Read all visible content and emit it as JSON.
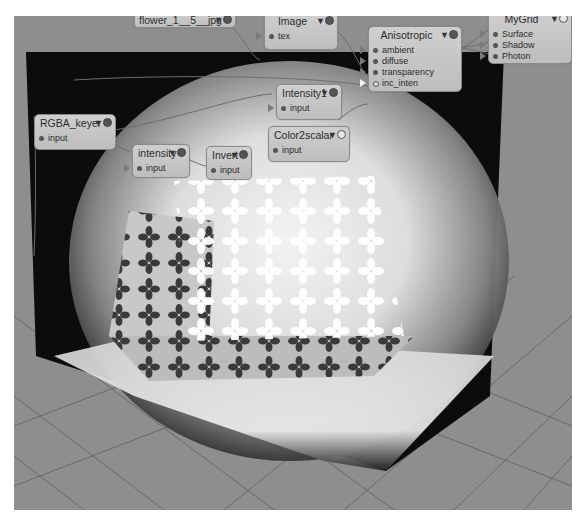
{
  "app": {
    "type": "node-based shader graph editor over 3D render viewport"
  },
  "nodes": {
    "flower": {
      "title": "flower_1__5__jpg",
      "ports": []
    },
    "image": {
      "title": "Image",
      "ports": [
        "tex"
      ]
    },
    "anisotropic": {
      "title": "Anisotropic",
      "ports": [
        "ambient",
        "diffuse",
        "transparency",
        "inc_inten"
      ]
    },
    "mygrid": {
      "title": "MyGrid",
      "ports": [
        "Surface",
        "Shadow",
        "Photon"
      ]
    },
    "intensity1": {
      "title": "Intensity1",
      "ports": [
        "input"
      ]
    },
    "rgba_keyer": {
      "title": "RGBA_keyer",
      "ports": [
        "input"
      ]
    },
    "color2scalar": {
      "title": "Color2scalar",
      "ports": [
        "input"
      ]
    },
    "intensity": {
      "title": "intensity",
      "ports": [
        "input"
      ]
    },
    "invert": {
      "title": "Invert",
      "ports": [
        "input"
      ]
    }
  },
  "icons": {
    "node_menu": "triangle-down",
    "node_toggle": "circle"
  },
  "colors": {
    "node_bg": "#c6c6c6",
    "node_border": "#8a8a8a",
    "floor": "#8e8e8e",
    "backdrop": "#0c0c0c",
    "light": "#f2f2f2"
  }
}
